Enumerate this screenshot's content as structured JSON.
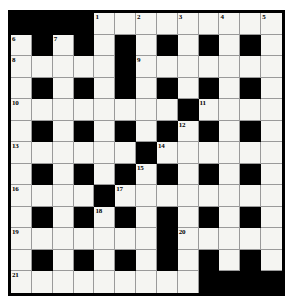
{
  "puzzle": {
    "title": "Crossword Grid",
    "type": "crossword",
    "columns": 13,
    "rows": 13,
    "colors": {
      "block": "#000000",
      "cell": "#f5f5f2",
      "grid_line": "#9a9a9a",
      "frame": "#000000",
      "page": "#ffffff"
    },
    "legend": {
      "white": "open letter square",
      "black": "blocked square"
    },
    "grid": [
      [
        "black",
        "black",
        "black",
        "black",
        "white",
        "white",
        "white",
        "white",
        "white",
        "white",
        "white",
        "white",
        "white"
      ],
      [
        "white",
        "black",
        "white",
        "black",
        "white",
        "black",
        "white",
        "black",
        "white",
        "black",
        "white",
        "black",
        "white"
      ],
      [
        "white",
        "white",
        "white",
        "white",
        "white",
        "black",
        "white",
        "white",
        "white",
        "white",
        "white",
        "white",
        "white"
      ],
      [
        "white",
        "black",
        "white",
        "black",
        "white",
        "black",
        "white",
        "black",
        "white",
        "black",
        "white",
        "black",
        "white"
      ],
      [
        "white",
        "white",
        "white",
        "white",
        "white",
        "white",
        "white",
        "white",
        "black",
        "white",
        "white",
        "white",
        "white"
      ],
      [
        "white",
        "black",
        "white",
        "black",
        "white",
        "black",
        "white",
        "black",
        "white",
        "black",
        "white",
        "black",
        "white"
      ],
      [
        "white",
        "white",
        "white",
        "white",
        "white",
        "white",
        "black",
        "white",
        "white",
        "white",
        "white",
        "white",
        "white"
      ],
      [
        "white",
        "black",
        "white",
        "black",
        "white",
        "black",
        "white",
        "black",
        "white",
        "black",
        "white",
        "black",
        "white"
      ],
      [
        "white",
        "white",
        "white",
        "white",
        "black",
        "white",
        "white",
        "white",
        "white",
        "white",
        "white",
        "white",
        "white"
      ],
      [
        "white",
        "black",
        "white",
        "black",
        "white",
        "black",
        "white",
        "black",
        "white",
        "black",
        "white",
        "black",
        "white"
      ],
      [
        "white",
        "white",
        "white",
        "white",
        "white",
        "white",
        "white",
        "black",
        "white",
        "white",
        "white",
        "white",
        "white"
      ],
      [
        "white",
        "black",
        "white",
        "black",
        "white",
        "black",
        "white",
        "black",
        "white",
        "black",
        "white",
        "black",
        "white"
      ],
      [
        "white",
        "white",
        "white",
        "white",
        "white",
        "white",
        "white",
        "white",
        "white",
        "black",
        "black",
        "black",
        "black"
      ]
    ],
    "numbers": [
      {
        "row": 0,
        "col": 4,
        "label": "1"
      },
      {
        "row": 0,
        "col": 6,
        "label": "2"
      },
      {
        "row": 0,
        "col": 8,
        "label": "3"
      },
      {
        "row": 0,
        "col": 10,
        "label": "4"
      },
      {
        "row": 0,
        "col": 12,
        "label": "5"
      },
      {
        "row": 1,
        "col": 0,
        "label": "6"
      },
      {
        "row": 1,
        "col": 2,
        "label": "7"
      },
      {
        "row": 2,
        "col": 0,
        "label": "8"
      },
      {
        "row": 2,
        "col": 6,
        "label": "9"
      },
      {
        "row": 4,
        "col": 0,
        "label": "10"
      },
      {
        "row": 4,
        "col": 9,
        "label": "11"
      },
      {
        "row": 5,
        "col": 8,
        "label": "12"
      },
      {
        "row": 6,
        "col": 0,
        "label": "13"
      },
      {
        "row": 6,
        "col": 7,
        "label": "14"
      },
      {
        "row": 7,
        "col": 6,
        "label": "15"
      },
      {
        "row": 8,
        "col": 0,
        "label": "16"
      },
      {
        "row": 8,
        "col": 5,
        "label": "17"
      },
      {
        "row": 9,
        "col": 4,
        "label": "18"
      },
      {
        "row": 10,
        "col": 0,
        "label": "19"
      },
      {
        "row": 10,
        "col": 8,
        "label": "20"
      },
      {
        "row": 12,
        "col": 0,
        "label": "21"
      }
    ]
  }
}
